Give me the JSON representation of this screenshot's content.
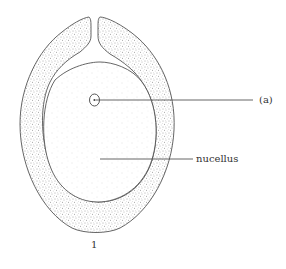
{
  "diagram": {
    "figure_number": "1",
    "labels": [
      {
        "id": "a",
        "text": "(a)",
        "points_to": "small cell within nucellus"
      },
      {
        "id": "nucellus",
        "text": "nucellus",
        "points_to": "nucellus tissue"
      }
    ],
    "parts": [
      {
        "id": "integument",
        "description": "stippled outer layer with micropyle opening at top"
      },
      {
        "id": "nucellus",
        "description": "lightly dotted central tissue"
      },
      {
        "id": "cell-a",
        "description": "small oval structure with dot"
      }
    ],
    "colors": {
      "line": "#555555",
      "stipple_dense": "#555555",
      "stipple_light": "#bbbbbb",
      "background": "#ffffff"
    }
  }
}
